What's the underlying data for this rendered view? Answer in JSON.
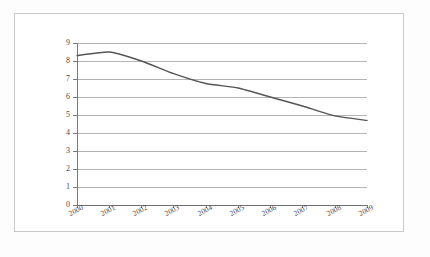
{
  "figure": {
    "border_color": "#c9c9c9",
    "background": "#ffffff"
  },
  "chart_data": {
    "type": "line",
    "title": "",
    "subtitle": "",
    "xlabel": "",
    "ylabel": "",
    "categories": [
      "2000",
      "2001",
      "2002",
      "2003",
      "2004",
      "2005",
      "2006",
      "2007",
      "2008",
      "2009"
    ],
    "series": [
      {
        "name": "",
        "color": "#555555",
        "values": [
          8.3,
          8.5,
          8.0,
          7.3,
          6.75,
          6.5,
          6.0,
          5.5,
          4.95,
          4.7
        ]
      }
    ],
    "ylim": [
      0,
      9
    ],
    "xlim": [
      "2000",
      "2009"
    ],
    "y_ticks": [
      0,
      1,
      2,
      3,
      4,
      5,
      6,
      7,
      8,
      9
    ],
    "y_tick_labels": [
      "0",
      "1",
      "2",
      "3",
      "4",
      "5",
      "6",
      "7",
      "8",
      "9"
    ],
    "x_tick_labels": [
      "2000",
      "2001",
      "2002",
      "2003",
      "2004",
      "2005",
      "2006",
      "2007",
      "2008",
      "2009"
    ],
    "grid": {
      "horizontal": true,
      "vertical": false,
      "color": "#b4b4b4"
    },
    "legend": {
      "visible": false,
      "position": "none",
      "entries": []
    },
    "annotations": [],
    "x_label_rotation_deg": -28
  }
}
